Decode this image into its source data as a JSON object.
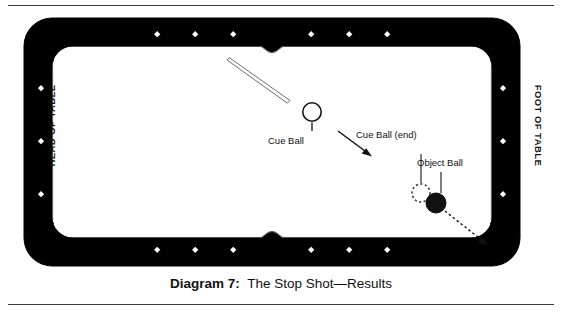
{
  "figure": {
    "caption_label": "Diagram 7:",
    "caption_text": "The Stop Shot—Results",
    "orientation_labels": {
      "left": "HEAD OF TABLE",
      "right": "FOOT OF TABLE"
    },
    "annotations": {
      "cue_ball": "Cue Ball",
      "cue_ball_end": "Cue Ball (end)",
      "object_ball": "Object Ball"
    },
    "colors": {
      "rail": "#000000",
      "cloth": "#ffffff",
      "ink": "#111111",
      "rule": "#3a3a3a"
    },
    "table": {
      "rail_diamonds_top": 6,
      "rail_diamonds_bottom": 6,
      "rail_diamonds_left": 3,
      "rail_diamonds_right": 3,
      "pockets": 6
    }
  }
}
